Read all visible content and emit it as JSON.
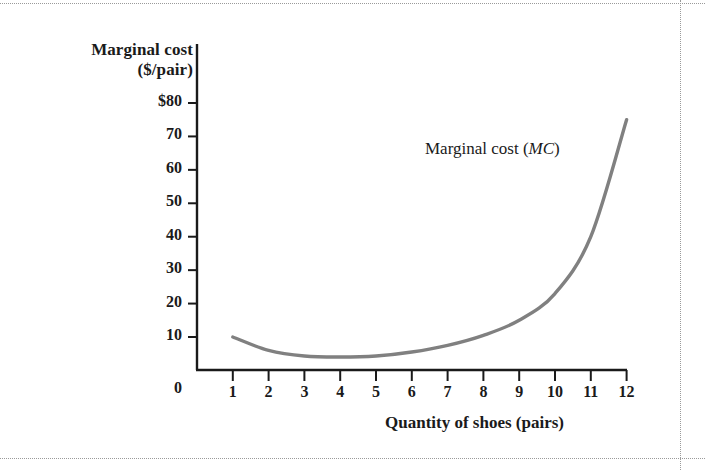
{
  "figure": {
    "curve_label_prefix": "Marginal cost (",
    "curve_label_italic": "MC",
    "curve_label_suffix": ")",
    "y_axis_title_line1": "Marginal cost",
    "y_axis_title_line2": "($/pair)",
    "x_axis_title": "Quantity of shoes (pairs)",
    "origin_label": "0",
    "curve_color": "#808080",
    "axis_color": "#1a1a1a",
    "text_color": "#1a1a1a",
    "frame_color": "#9a9a9a"
  },
  "chart_data": {
    "type": "line",
    "title": "",
    "subtitle": "",
    "xlabel": "Quantity of shoes (pairs)",
    "ylabel": "Marginal cost ($/pair)",
    "xlim": [
      0,
      12.6
    ],
    "ylim": [
      0,
      84
    ],
    "grid": false,
    "legend": "inline-annotation",
    "legend_position": "upper-right-inside",
    "x_tick_labels": [
      "1",
      "2",
      "3",
      "4",
      "5",
      "6",
      "7",
      "8",
      "9",
      "10",
      "11",
      "12"
    ],
    "x_ticks": [
      1,
      2,
      3,
      4,
      5,
      6,
      7,
      8,
      9,
      10,
      11,
      12
    ],
    "y_tick_labels": [
      "$80",
      "70",
      "60",
      "50",
      "40",
      "30",
      "20",
      "10"
    ],
    "y_ticks": [
      80,
      70,
      60,
      50,
      40,
      30,
      20,
      10
    ],
    "annotations": [
      {
        "text": "Marginal cost (MC)",
        "x": 8.6,
        "y": 64
      }
    ],
    "series": [
      {
        "name": "Marginal cost (MC)",
        "color": "#808080",
        "x": [
          1,
          2,
          3,
          4,
          5,
          6,
          7,
          8,
          9,
          10,
          11,
          12
        ],
        "values": [
          10,
          6,
          4.3,
          4,
          4.3,
          5.5,
          7.5,
          10.5,
          15,
          23,
          40,
          75
        ]
      }
    ]
  }
}
